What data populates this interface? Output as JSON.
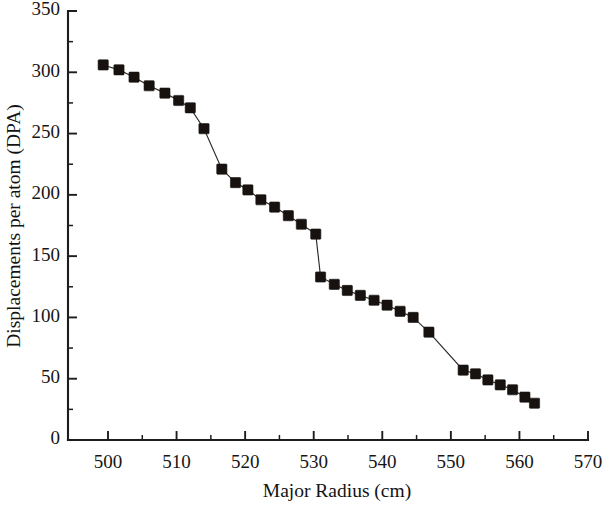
{
  "chart_data": {
    "type": "scatter",
    "title": "",
    "xlabel": "Major Radius (cm)",
    "ylabel": "Displacements per atom (DPA)",
    "xlim": [
      495,
      570
    ],
    "ylim": [
      0,
      350
    ],
    "x_ticks": [
      500,
      510,
      520,
      530,
      540,
      550,
      560,
      570
    ],
    "x_tick_labels": [
      "500",
      "510",
      "520",
      "530",
      "540",
      "550",
      "560",
      "570"
    ],
    "x_minor_interval": 5,
    "y_ticks": [
      0,
      50,
      100,
      150,
      200,
      250,
      300,
      350
    ],
    "y_tick_labels": [
      "0",
      "50",
      "100",
      "150",
      "200",
      "250",
      "300",
      "350"
    ],
    "y_minor_interval": 25,
    "grid": false,
    "legend": null,
    "marker": "square",
    "marker_color": "#17120f",
    "line_color": "#2a2a2a",
    "series": [
      {
        "name": "DPA profile",
        "x": [
          499.3,
          501.6,
          503.8,
          506.0,
          508.3,
          510.3,
          512.0,
          514.0,
          516.6,
          518.6,
          520.4,
          522.3,
          524.3,
          526.3,
          528.2,
          530.3,
          531.0,
          533.0,
          534.9,
          536.8,
          538.8,
          540.7,
          542.6,
          544.5,
          546.8,
          551.8,
          553.6,
          555.4,
          557.2,
          559.0,
          560.8,
          562.2
        ],
        "y": [
          306,
          302,
          296,
          289,
          283,
          277,
          271,
          254,
          221,
          210,
          204,
          196,
          190,
          183,
          176,
          168,
          133,
          127,
          122,
          118,
          114,
          110,
          105,
          100,
          88,
          57,
          54,
          49,
          45,
          41,
          35,
          30
        ]
      }
    ]
  },
  "figure": {
    "plot_left_px": 68,
    "plot_right_px": 588,
    "plot_top_px": 11,
    "plot_bottom_px": 440
  }
}
